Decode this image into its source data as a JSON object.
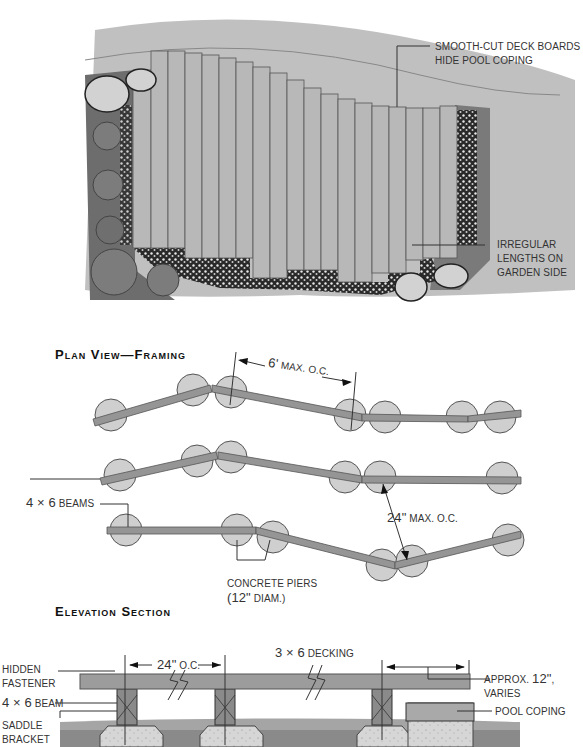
{
  "top_plan": {
    "callout_smooth_line1": "SMOOTH-CUT DECK BOARDS",
    "callout_smooth_line2": "HIDE POOL COPING",
    "callout_irregular_line1": "IRREGULAR",
    "callout_irregular_line2": "LENGTHS ON",
    "callout_irregular_line3": "GARDEN SIDE"
  },
  "plan_framing": {
    "heading": "Plan View—Framing",
    "spacing_label_num": "6'",
    "spacing_label_text": "MAX. O.C.",
    "beams_label_num": "4 × 6",
    "beams_label_text": "BEAMS",
    "beam_spacing_num": "24\"",
    "beam_spacing_text": "MAX. O.C.",
    "piers_line1": "CONCRETE PIERS",
    "piers_line2_num": "(12\"",
    "piers_line2_text": "DIAM.)"
  },
  "elevation": {
    "heading": "Elevation Section",
    "hidden_fastener_line1": "HIDDEN",
    "hidden_fastener_line2": "FASTENER",
    "beam_num": "4 × 6",
    "beam_text": "BEAM",
    "saddle_line1": "SADDLE",
    "saddle_line2": "BRACKET",
    "oc_num": "24\"",
    "oc_text": "O.C.",
    "decking_num": "3 × 6",
    "decking_text": "DECKING",
    "approx_pre": "APPROX.",
    "approx_num": "12\"",
    "approx_post": ", VARIES",
    "pool_coping": "POOL COPING"
  },
  "colors": {
    "deck_board": "#b8b8b8",
    "beam": "#8f8f8f",
    "pier": "#c8c8c8",
    "ground": "#9a9a9a",
    "text": "#333333"
  }
}
